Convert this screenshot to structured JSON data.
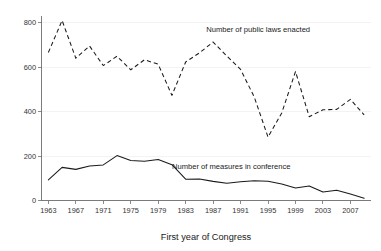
{
  "chart_data": {
    "type": "line",
    "title": "",
    "subtitle": "",
    "xlabel": "First year of Congress",
    "ylabel": "",
    "xlim": [
      1962,
      2010
    ],
    "ylim": [
      0,
      830
    ],
    "grid": true,
    "grid_axis": "y",
    "legend_position": "inline-annotation",
    "x": [
      1963,
      1965,
      1967,
      1969,
      1971,
      1973,
      1975,
      1977,
      1979,
      1981,
      1983,
      1985,
      1987,
      1989,
      1991,
      1993,
      1995,
      1997,
      1999,
      2001,
      2003,
      2005,
      2007,
      2009
    ],
    "y_ticks": [
      0,
      200,
      400,
      600,
      800
    ],
    "y_tick_labels": [
      "0",
      "200",
      "400",
      "600",
      "800"
    ],
    "x_ticks": [
      1963,
      1967,
      1971,
      1975,
      1979,
      1983,
      1987,
      1991,
      1995,
      1999,
      2003,
      2007
    ],
    "x_tick_labels": [
      "1963",
      "1967",
      "1971",
      "1975",
      "1979",
      "1983",
      "1987",
      "1991",
      "1995",
      "1999",
      "2003",
      "2007"
    ],
    "series": [
      {
        "name": "Number of public laws enacted",
        "style": "dashed",
        "color": "#1a1a1a",
        "annotation_label": "Number of public laws enacted",
        "values": [
          666,
          810,
          640,
          695,
          607,
          649,
          588,
          633,
          613,
          473,
          623,
          664,
          713,
          650,
          590,
          465,
          285,
          394,
          580,
          377,
          408,
          410,
          455,
          385
        ]
      },
      {
        "name": "Number of measures in conference",
        "style": "solid",
        "color": "#1a1a1a",
        "annotation_label": "Number of measures in conference",
        "values": [
          93,
          149,
          140,
          155,
          160,
          202,
          180,
          177,
          184,
          161,
          96,
          97,
          86,
          78,
          84,
          89,
          87,
          74,
          56,
          65,
          38,
          46,
          29,
          10
        ]
      }
    ],
    "annotations": [
      {
        "text": "Number of public laws enacted",
        "x_value": 1986,
        "y_value": 760
      },
      {
        "text": "Number of measures in conference",
        "x_value": 1981,
        "y_value": 140
      }
    ]
  },
  "axis": {
    "x_title": "First year of Congress"
  }
}
